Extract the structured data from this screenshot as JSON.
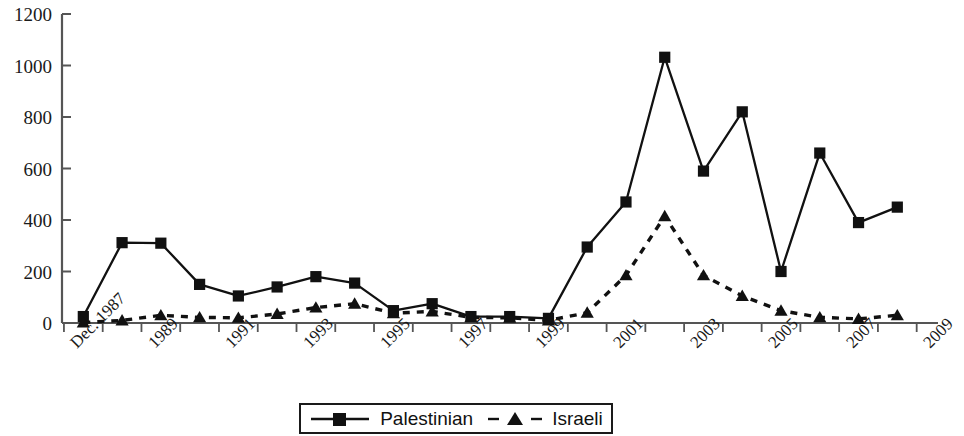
{
  "chart_data": {
    "type": "line",
    "title": "",
    "subtitle": "",
    "xlabel": "",
    "ylabel": "",
    "grid": false,
    "legend_position": "bottom-center",
    "ylim": [
      0,
      1200
    ],
    "ytick_labels": [
      "1200",
      "1000",
      "800",
      "600",
      "400",
      "200",
      "0"
    ],
    "ytick_values": [
      1200,
      1000,
      800,
      600,
      400,
      200,
      0
    ],
    "x": [
      "Dec. 1987",
      "1988",
      "1989",
      "1990",
      "1991",
      "1992",
      "1993",
      "1994",
      "1995",
      "1996",
      "1997",
      "1998",
      "1999",
      "2000",
      "2001",
      "2002",
      "2003",
      "2004",
      "2005",
      "2006",
      "2007",
      "2008"
    ],
    "xtick_labels": [
      "Dec. 1987",
      "1989",
      "1991",
      "1993",
      "1995",
      "1997",
      "1999",
      "2001",
      "2003",
      "2005",
      "2007",
      "2009"
    ],
    "xtick_label_indices": [
      0,
      2,
      4,
      6,
      8,
      10,
      12,
      14,
      16,
      18,
      20,
      22
    ],
    "series": [
      {
        "name": "Palestinian",
        "marker": "square",
        "line_style": "solid",
        "color": "#111111",
        "values": [
          25,
          312,
          310,
          150,
          105,
          140,
          180,
          155,
          48,
          75,
          25,
          25,
          18,
          295,
          470,
          1032,
          590,
          820,
          200,
          660,
          390,
          450
        ]
      },
      {
        "name": "Israeli",
        "marker": "triangle",
        "line_style": "dashed",
        "color": "#111111",
        "values": [
          2,
          10,
          30,
          22,
          20,
          35,
          60,
          75,
          38,
          45,
          22,
          20,
          10,
          40,
          185,
          415,
          185,
          105,
          48,
          22,
          16,
          30
        ]
      }
    ]
  },
  "legend": {
    "entries": [
      {
        "label": "Palestinian",
        "marker": "square-marker-icon",
        "line": "solid-line-icon"
      },
      {
        "label": "Israeli",
        "marker": "triangle-marker-icon",
        "line": "dashed-line-icon"
      }
    ]
  },
  "axis": {
    "line_color": "#555555",
    "tick_color": "#555555"
  }
}
